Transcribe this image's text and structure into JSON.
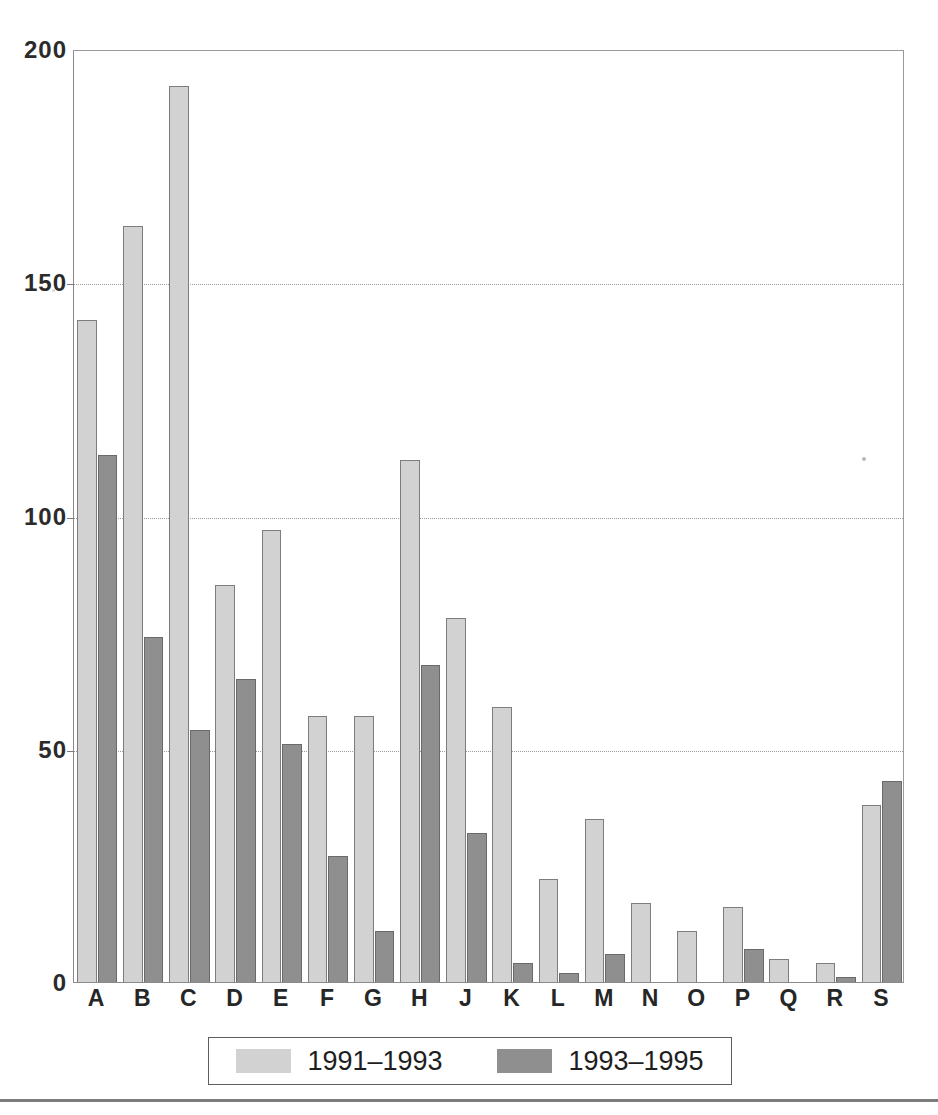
{
  "chart_data": {
    "type": "bar",
    "title": "",
    "subtitle": "",
    "xlabel": "",
    "ylabel": "",
    "ylim": [
      0,
      200
    ],
    "yticks": [
      0,
      50,
      100,
      150,
      200
    ],
    "ytick_labels": [
      "0",
      "50",
      "100",
      "150",
      "200"
    ],
    "grid": true,
    "grid_axis": "y",
    "grid_style": "dotted",
    "legend_position": "bottom-center",
    "categories": [
      "A",
      "B",
      "C",
      "D",
      "E",
      "F",
      "G",
      "H",
      "J",
      "K",
      "L",
      "M",
      "N",
      "O",
      "P",
      "Q",
      "R",
      "S"
    ],
    "series": [
      {
        "name": "1991–1993",
        "color": "#d2d2d2",
        "values": [
          142,
          162,
          192,
          85,
          97,
          57,
          57,
          112,
          78,
          59,
          22,
          35,
          17,
          11,
          16,
          5,
          4,
          38
        ]
      },
      {
        "name": "1993–1995",
        "color": "#8f8f8f",
        "values": [
          113,
          74,
          54,
          65,
          51,
          27,
          11,
          68,
          32,
          4,
          2,
          6,
          0,
          0,
          7,
          0,
          1,
          43
        ]
      }
    ]
  },
  "axes": {
    "y_ticks": [
      {
        "value": 200,
        "label": "200"
      },
      {
        "value": 150,
        "label": "150"
      },
      {
        "value": 100,
        "label": "100"
      },
      {
        "value": 50,
        "label": "50"
      },
      {
        "value": 0,
        "label": "0"
      }
    ],
    "x_categories": [
      "A",
      "B",
      "C",
      "D",
      "E",
      "F",
      "G",
      "H",
      "J",
      "K",
      "L",
      "M",
      "N",
      "O",
      "P",
      "Q",
      "R",
      "S"
    ]
  },
  "legend": {
    "entries": [
      {
        "label": "1991–1993",
        "swatch": "light-gray-swatch",
        "color": "#d2d2d2"
      },
      {
        "label": "1993–1995",
        "swatch": "dark-gray-swatch",
        "color": "#8f8f8f"
      }
    ]
  },
  "colors": {
    "series_1991_1993": "#d2d2d2",
    "series_1993_1995": "#8f8f8f",
    "bar_outline": "#7d7d7d",
    "axis": "#8a8a8a",
    "gridline": "#9b9b9b",
    "text": "#262626",
    "background": "#ffffff"
  }
}
